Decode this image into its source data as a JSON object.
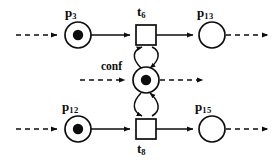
{
  "diagram": {
    "colors": {
      "stroke": "#0d0d0d",
      "fill": "#ffffff",
      "token": "#0d0d0d",
      "background": "#ffffff"
    },
    "places": [
      {
        "id": "p3",
        "label_text": "p",
        "label_sub": "3",
        "tokens": 1,
        "cx": 78,
        "cy": 35,
        "r": 13,
        "label_x": 65,
        "label_y": 8
      },
      {
        "id": "p13",
        "label_text": "p",
        "label_sub": "13",
        "tokens": 0,
        "cx": 212,
        "cy": 35,
        "r": 13,
        "label_x": 198,
        "label_y": 8
      },
      {
        "id": "conf",
        "label_text": "conf",
        "label_sub": "",
        "tokens": 1,
        "cx": 146,
        "cy": 80,
        "r": 13,
        "label_x": 101,
        "label_y": 62
      },
      {
        "id": "p12",
        "label_text": "p",
        "label_sub": "12",
        "tokens": 1,
        "cx": 78,
        "cy": 129,
        "r": 13,
        "label_x": 63,
        "label_y": 101
      },
      {
        "id": "p15",
        "label_text": "p",
        "label_sub": "15",
        "tokens": 0,
        "cx": 212,
        "cy": 129,
        "r": 13,
        "label_x": 196,
        "label_y": 101
      }
    ],
    "transitions": [
      {
        "id": "t6",
        "label_text": "t",
        "label_sub": "6",
        "x": 136,
        "y": 25,
        "w": 20,
        "h": 20,
        "label_x": 137,
        "label_y": 7
      },
      {
        "id": "t8",
        "label_text": "t",
        "label_sub": "8",
        "x": 136,
        "y": 119,
        "w": 20,
        "h": 20,
        "label_x": 137,
        "label_y": 142
      }
    ],
    "arcs": [
      {
        "name": "arc-in-p3",
        "style": "dashed",
        "from": "left-edge",
        "to": "p3"
      },
      {
        "name": "arc-p3-t6",
        "style": "solid",
        "from": "p3",
        "to": "t6"
      },
      {
        "name": "arc-t6-p13",
        "style": "solid",
        "from": "t6",
        "to": "p13"
      },
      {
        "name": "arc-out-p13",
        "style": "dashed",
        "from": "p13",
        "to": "right-edge"
      },
      {
        "name": "arc-in-conf",
        "style": "dashed",
        "from": "left",
        "to": "conf"
      },
      {
        "name": "arc-out-conf",
        "style": "dashed",
        "from": "conf",
        "to": "right"
      },
      {
        "name": "arc-conf-t6",
        "style": "solid-curved",
        "from": "conf",
        "to": "t6"
      },
      {
        "name": "arc-t6-conf",
        "style": "solid-curved",
        "from": "t6",
        "to": "conf"
      },
      {
        "name": "arc-conf-t8",
        "style": "solid-curved",
        "from": "conf",
        "to": "t8"
      },
      {
        "name": "arc-t8-conf",
        "style": "solid-curved",
        "from": "t8",
        "to": "conf"
      },
      {
        "name": "arc-in-p12",
        "style": "dashed",
        "from": "left-edge",
        "to": "p12"
      },
      {
        "name": "arc-p12-t8",
        "style": "solid",
        "from": "p12",
        "to": "t8"
      },
      {
        "name": "arc-t8-p15",
        "style": "solid",
        "from": "t8",
        "to": "p15"
      },
      {
        "name": "arc-out-p15",
        "style": "dashed",
        "from": "p15",
        "to": "right-edge"
      }
    ]
  }
}
